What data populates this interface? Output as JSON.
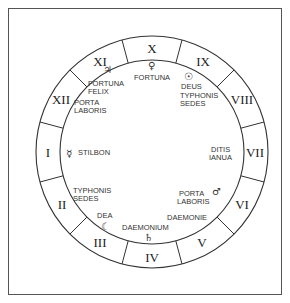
{
  "diagram": {
    "type": "astrological-houses-wheel",
    "houses": [
      {
        "numeral": "I"
      },
      {
        "numeral": "II"
      },
      {
        "numeral": "III"
      },
      {
        "numeral": "IV"
      },
      {
        "numeral": "V"
      },
      {
        "numeral": "VI"
      },
      {
        "numeral": "VII"
      },
      {
        "numeral": "VIII"
      },
      {
        "numeral": "IX"
      },
      {
        "numeral": "X"
      },
      {
        "numeral": "XI"
      },
      {
        "numeral": "XII"
      }
    ],
    "labels": {
      "house1": {
        "line1": "STILBON",
        "glyph": "☿",
        "glyph_name": "mercury"
      },
      "house2": {
        "line1": "TYPHONIS",
        "line2": "SEDES"
      },
      "house3": {
        "line1": "DEA",
        "glyph": "☾",
        "glyph_name": "moon"
      },
      "house4": {
        "line1": "DAEMONIUM",
        "glyph": "♄",
        "glyph_name": "saturn"
      },
      "house5": {
        "line1": "DAEMONIE"
      },
      "house6": {
        "line1": "PORTA",
        "line2": "LABORIS",
        "glyph": "♂",
        "glyph_name": "mars"
      },
      "house7": {
        "line1": "DITIS",
        "line2": "IANUA"
      },
      "house8": {
        "line1": "TYPHONIS",
        "line2": "SEDES"
      },
      "house9": {
        "line1": "DEUS",
        "glyph": "☉",
        "glyph_name": "sun"
      },
      "house10": {
        "line1": "FORTUNA",
        "glyph": "♀",
        "glyph_name": "venus"
      },
      "house11": {
        "line1": "FORTUNA",
        "line2": "FELIX",
        "glyph": "♃",
        "glyph_name": "jupiter"
      },
      "house12": {
        "line1": "PORTA",
        "line2": "LABORIS"
      }
    },
    "colors": {
      "line": "#333333",
      "text": "#222222",
      "background": "#ffffff"
    }
  }
}
